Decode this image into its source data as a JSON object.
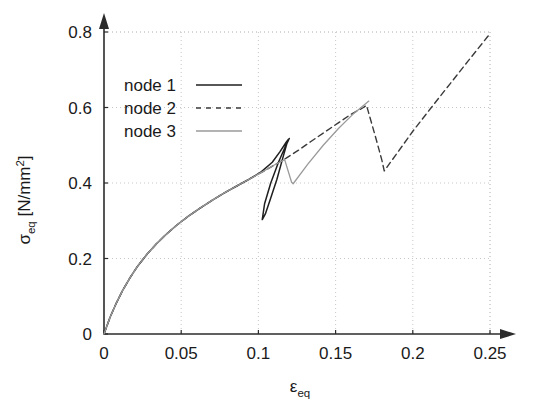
{
  "chart_data": {
    "type": "line",
    "title": "",
    "xlabel": "ε_eq",
    "xlabel_base": "ε",
    "xlabel_sub": "eq",
    "ylabel": "σ_eq [N/mm^2]",
    "ylabel_base": "σ",
    "ylabel_sub": "eq",
    "ylabel_unit_open": " [N/mm",
    "ylabel_unit_sup": "2",
    "ylabel_unit_close": "]",
    "xlim": [
      0,
      0.25
    ],
    "ylim": [
      0,
      0.8
    ],
    "xticks": [
      0,
      0.05,
      0.1,
      0.15,
      0.2,
      0.25
    ],
    "xticklabels": [
      "0",
      "0.05",
      "0.1",
      "0.15",
      "0.2",
      "0.25"
    ],
    "yticks": [
      0,
      0.2,
      0.4,
      0.6,
      0.8
    ],
    "yticklabels": [
      "0",
      "0.2",
      "0.4",
      "0.6",
      "0.8"
    ],
    "grid": true,
    "grid_style": "dotted",
    "grid_color": "#c8c8c8",
    "axis_color": "#2b2b2b",
    "axis_arrows": true,
    "legend_position": "upper-left-inside",
    "series": [
      {
        "name": "node 1",
        "label": "node 1",
        "style": "solid",
        "color": "#1f1f1f",
        "width": 1.5,
        "points": [
          [
            0.0,
            0.0
          ],
          [
            0.004,
            0.045
          ],
          [
            0.008,
            0.082
          ],
          [
            0.012,
            0.115
          ],
          [
            0.017,
            0.15
          ],
          [
            0.022,
            0.181
          ],
          [
            0.028,
            0.212
          ],
          [
            0.034,
            0.239
          ],
          [
            0.04,
            0.263
          ],
          [
            0.047,
            0.288
          ],
          [
            0.054,
            0.31
          ],
          [
            0.062,
            0.333
          ],
          [
            0.07,
            0.354
          ],
          [
            0.078,
            0.374
          ],
          [
            0.086,
            0.392
          ],
          [
            0.094,
            0.41
          ],
          [
            0.102,
            0.43
          ],
          [
            0.109,
            0.455
          ],
          [
            0.114,
            0.483
          ],
          [
            0.118,
            0.508
          ],
          [
            0.1195,
            0.516
          ],
          [
            0.113,
            0.455
          ],
          [
            0.108,
            0.4
          ],
          [
            0.104,
            0.345
          ],
          [
            0.1025,
            0.303
          ],
          [
            0.1045,
            0.318
          ],
          [
            0.108,
            0.36
          ],
          [
            0.112,
            0.41
          ],
          [
            0.1155,
            0.462
          ],
          [
            0.1185,
            0.505
          ],
          [
            0.12,
            0.518
          ]
        ]
      },
      {
        "name": "node 2",
        "label": "node 2",
        "style": "dashed",
        "color": "#3a3a3a",
        "width": 1.4,
        "points": [
          [
            0.0,
            0.0
          ],
          [
            0.004,
            0.045
          ],
          [
            0.008,
            0.082
          ],
          [
            0.012,
            0.115
          ],
          [
            0.017,
            0.15
          ],
          [
            0.022,
            0.181
          ],
          [
            0.028,
            0.212
          ],
          [
            0.034,
            0.239
          ],
          [
            0.04,
            0.263
          ],
          [
            0.047,
            0.288
          ],
          [
            0.054,
            0.31
          ],
          [
            0.062,
            0.333
          ],
          [
            0.07,
            0.354
          ],
          [
            0.078,
            0.374
          ],
          [
            0.086,
            0.392
          ],
          [
            0.094,
            0.41
          ],
          [
            0.102,
            0.428
          ],
          [
            0.11,
            0.447
          ],
          [
            0.118,
            0.466
          ],
          [
            0.126,
            0.487
          ],
          [
            0.134,
            0.51
          ],
          [
            0.143,
            0.535
          ],
          [
            0.152,
            0.56
          ],
          [
            0.16,
            0.582
          ],
          [
            0.168,
            0.6
          ],
          [
            0.17,
            0.606
          ],
          [
            0.17,
            0.606
          ],
          [
            0.176,
            0.52
          ],
          [
            0.18,
            0.46
          ],
          [
            0.1815,
            0.432
          ],
          [
            0.19,
            0.48
          ],
          [
            0.2,
            0.537
          ],
          [
            0.212,
            0.6
          ],
          [
            0.224,
            0.662
          ],
          [
            0.236,
            0.724
          ],
          [
            0.2485,
            0.788
          ],
          [
            0.25,
            0.795
          ]
        ]
      },
      {
        "name": "node 3",
        "label": "node 3",
        "style": "solid",
        "color": "#9a9a9a",
        "width": 1.3,
        "points": [
          [
            0.0,
            0.0
          ],
          [
            0.004,
            0.045
          ],
          [
            0.008,
            0.082
          ],
          [
            0.012,
            0.115
          ],
          [
            0.017,
            0.15
          ],
          [
            0.022,
            0.181
          ],
          [
            0.028,
            0.212
          ],
          [
            0.034,
            0.239
          ],
          [
            0.04,
            0.263
          ],
          [
            0.047,
            0.288
          ],
          [
            0.054,
            0.31
          ],
          [
            0.062,
            0.333
          ],
          [
            0.07,
            0.354
          ],
          [
            0.078,
            0.374
          ],
          [
            0.086,
            0.392
          ],
          [
            0.094,
            0.41
          ],
          [
            0.102,
            0.428
          ],
          [
            0.11,
            0.447
          ],
          [
            0.117,
            0.462
          ],
          [
            0.1215,
            0.402
          ],
          [
            0.1225,
            0.398
          ],
          [
            0.132,
            0.45
          ],
          [
            0.142,
            0.5
          ],
          [
            0.152,
            0.545
          ],
          [
            0.162,
            0.585
          ],
          [
            0.17,
            0.612
          ],
          [
            0.1715,
            0.617
          ]
        ]
      }
    ],
    "annotations": []
  },
  "legend": {
    "entries": [
      {
        "label": "node 1",
        "style": "solid",
        "color": "#1f1f1f"
      },
      {
        "label": "node 2",
        "style": "dashed",
        "color": "#3a3a3a"
      },
      {
        "label": "node 3",
        "style": "solid",
        "color": "#9a9a9a"
      }
    ]
  }
}
